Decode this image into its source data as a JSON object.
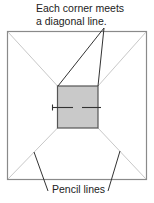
{
  "labels": {
    "top_line1": "Each corner meets",
    "top_line2": "a diagonal line.",
    "bottom": "Pencil lines"
  },
  "colors": {
    "outer_square": "#8a8a8a",
    "pencil_line": "#c8c8c8",
    "inner_fill": "#c9c9c9",
    "inner_stroke": "#555555",
    "callout": "#333333",
    "center_line": "#333333"
  },
  "shapes": {
    "outer_square": {
      "x": 7,
      "y": 31,
      "width": 139,
      "height": 148
    },
    "inner_square": {
      "x": 57,
      "y": 86,
      "width": 41,
      "height": 42
    },
    "center_line": {
      "y": 107,
      "x1": 52,
      "x2": 101,
      "gap_start": 73,
      "gap_end": 82
    }
  }
}
